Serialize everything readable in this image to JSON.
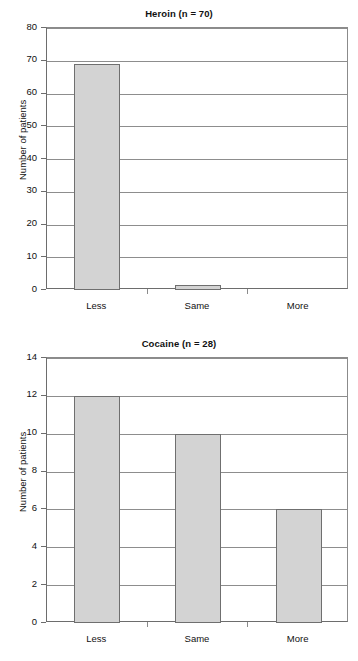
{
  "chart_data": [
    {
      "id": "heroin",
      "type": "bar",
      "title": "Heroin (n = 70)",
      "xlabel": "",
      "ylabel": "Number of patients",
      "categories": [
        "Less",
        "Same",
        "More"
      ],
      "values": [
        69,
        1.5,
        0
      ],
      "ylim": [
        0,
        80
      ],
      "yticks": [
        0,
        10,
        20,
        30,
        40,
        50,
        60,
        70,
        80
      ],
      "ytick_labels": [
        "0",
        "10",
        "20",
        "30",
        "40",
        "50",
        "60",
        "70",
        "80"
      ],
      "grid": true,
      "legend": "none",
      "bar_fill": "#d3d3d3",
      "bar_edge": "#6f6f6f"
    },
    {
      "id": "cocaine",
      "type": "bar",
      "title": "Cocaine (n = 28)",
      "xlabel": "",
      "ylabel": "Number of patients",
      "categories": [
        "Less",
        "Same",
        "More"
      ],
      "values": [
        12,
        10,
        6
      ],
      "ylim": [
        0,
        14
      ],
      "yticks": [
        0,
        2,
        4,
        6,
        8,
        10,
        12,
        14
      ],
      "ytick_labels": [
        "0",
        "2",
        "4",
        "6",
        "8",
        "10",
        "12",
        "14"
      ],
      "grid": true,
      "legend": "none",
      "bar_fill": "#d3d3d3",
      "bar_edge": "#6f6f6f"
    }
  ]
}
